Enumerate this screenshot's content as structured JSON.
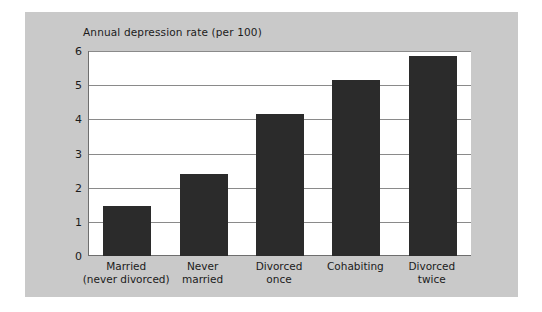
{
  "chart_data": {
    "type": "bar",
    "title": "Annual depression rate (per 100)",
    "xlabel": "",
    "ylabel": "",
    "ylim": [
      0,
      6
    ],
    "yticks": [
      "0",
      "1",
      "2",
      "3",
      "4",
      "5",
      "6"
    ],
    "grid": true,
    "legend": "none",
    "bar_color": "#2b2b2b",
    "panel_color": "#c9c9c9",
    "plot_background": "#ffffff",
    "categories": [
      "Married\n(never divorced)",
      "Never\nmarried",
      "Divorced\nonce",
      "Cohabiting",
      "Divorced\ntwice"
    ],
    "values": [
      1.45,
      2.4,
      4.15,
      5.15,
      5.85
    ]
  }
}
